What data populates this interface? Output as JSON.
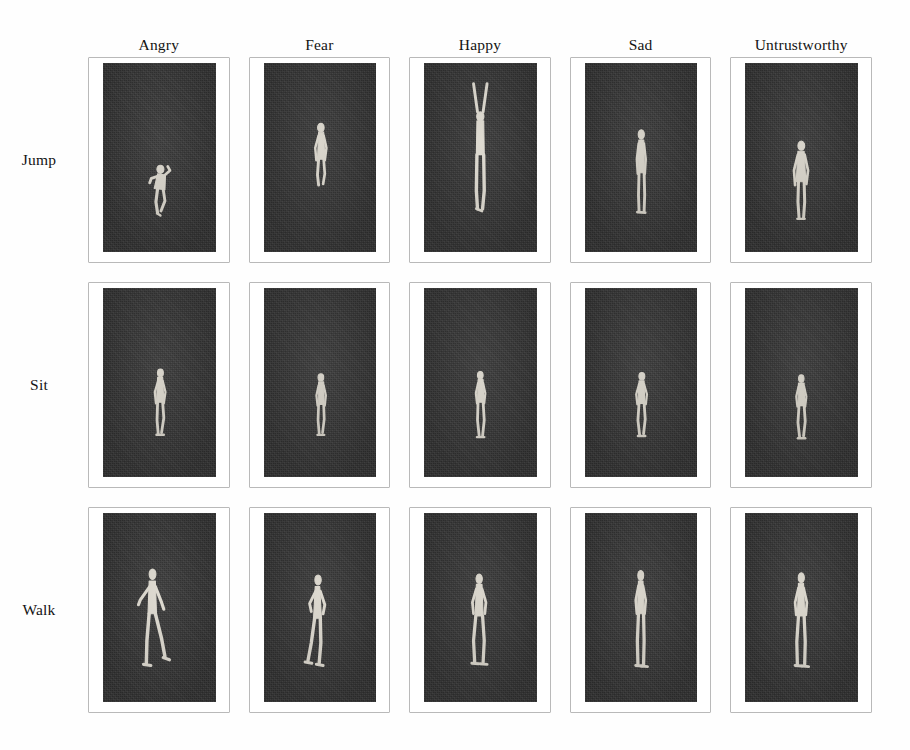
{
  "figure": {
    "background_color": "#ffffff",
    "panel_color": "#343434",
    "frame_color": "#b9b9b9",
    "figure_color": "#d9d5cc",
    "columns": [
      {
        "id": "angry",
        "label": "Angry"
      },
      {
        "id": "fear",
        "label": "Fear"
      },
      {
        "id": "happy",
        "label": "Happy"
      },
      {
        "id": "sad",
        "label": "Sad"
      },
      {
        "id": "untrustworthy",
        "label": "Untrustworthy"
      }
    ],
    "rows": [
      {
        "id": "jump",
        "label": "Jump"
      },
      {
        "id": "sit",
        "label": "Sit"
      },
      {
        "id": "walk",
        "label": "Walk"
      }
    ],
    "cells": [
      {
        "row": "Jump",
        "column": "Angry",
        "description": "Crouched figure mid-jump, arms bent up near the chest, knees tucked, body leaning forward, centered slightly right and low in the frame."
      },
      {
        "row": "Jump",
        "column": "Fear",
        "description": "Slender upright figure suspended mid-air, arms held tight against the torso, legs together, positioned in the middle of the frame."
      },
      {
        "row": "Jump",
        "column": "Happy",
        "description": "Tall extended figure with both arms raised overhead in a wide V, legs straight and together, occupying the upper two thirds of the frame."
      },
      {
        "row": "Jump",
        "column": "Sad",
        "description": "Narrow upright figure with arms held straight down at the sides, head slightly lowered, standing near the lower middle of the frame."
      },
      {
        "row": "Jump",
        "column": "Untrustworthy",
        "description": "Upright figure with arms hanging loosely and shoulders angled, body turned slightly away, placed just below center."
      },
      {
        "row": "Sit",
        "column": "Angry",
        "description": "Small seated figure with arms drawn in and torso angled forward, legs bent beneath, in the lower middle of the frame."
      },
      {
        "row": "Sit",
        "column": "Fear",
        "description": "Small compact seated figure with arms close to the body and knees bent, slightly hunched, in the lower middle of the frame."
      },
      {
        "row": "Sit",
        "column": "Happy",
        "description": "Small seated figure with upright torso and bent legs, head held up, in the lower middle of the frame."
      },
      {
        "row": "Sit",
        "column": "Sad",
        "description": "Small seated figure slumped forward with head lowered and arms hanging, in the lower middle of the frame."
      },
      {
        "row": "Sit",
        "column": "Untrustworthy",
        "description": "Small seated figure turned slightly aside with arms close to the torso, in the lower middle of the frame."
      },
      {
        "row": "Walk",
        "column": "Angry",
        "description": "Side-view walking figure in a wide stride, front leg extended forward, arms swinging, body leaning into the step, left of center."
      },
      {
        "row": "Walk",
        "column": "Fear",
        "description": "Side-view walking figure with a shorter stride, arms held close to the body, slight forward hunch, left of center."
      },
      {
        "row": "Walk",
        "column": "Happy",
        "description": "Walking figure seen near frontally with a light stride and relaxed arms, centered in the frame."
      },
      {
        "row": "Walk",
        "column": "Sad",
        "description": "Narrow walking figure with a short stride, head lowered and arms hanging straight down, centered in the frame."
      },
      {
        "row": "Walk",
        "column": "Untrustworthy",
        "description": "Walking figure with a narrow stride and arms held near the torso, slight sideways orientation, centered in the frame."
      }
    ]
  }
}
